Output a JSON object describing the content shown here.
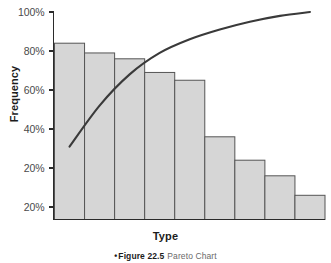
{
  "figure": {
    "caption_bullet": "•",
    "caption_label": "Figure 22.5",
    "caption_title": "Pareto Chart"
  },
  "chart_data": {
    "type": "bar",
    "title": "Pareto Chart",
    "xlabel": "Type",
    "ylabel": "Frequency",
    "categories": [
      "1",
      "2",
      "3",
      "4",
      "5",
      "6",
      "7",
      "8",
      "9"
    ],
    "values": [
      84,
      79,
      76,
      69,
      65,
      36,
      24,
      16,
      6
    ],
    "value_unit": "%",
    "ylim": [
      0,
      100
    ],
    "grid": false,
    "legend": "none",
    "ytick_labels": [
      "100%",
      "80%",
      "60%",
      "40%",
      "20%",
      "20%"
    ],
    "ytick_values": [
      100,
      80,
      60,
      40,
      20,
      0
    ],
    "xtick_labels": [],
    "series": [
      {
        "name": "Frequency",
        "type": "bar",
        "values": [
          84,
          79,
          76,
          69,
          65,
          36,
          24,
          16,
          6
        ],
        "fill_color": "#d6d6d6",
        "stroke_color": "#555555"
      },
      {
        "name": "Cumulative Percentage",
        "type": "line",
        "values": [
          31,
          52,
          68,
          79,
          86,
          91,
          95,
          98,
          100
        ],
        "stroke_color": "#3a3a3a"
      }
    ],
    "axis_color": "#2b2b2b",
    "background_color": "#ffffff"
  }
}
